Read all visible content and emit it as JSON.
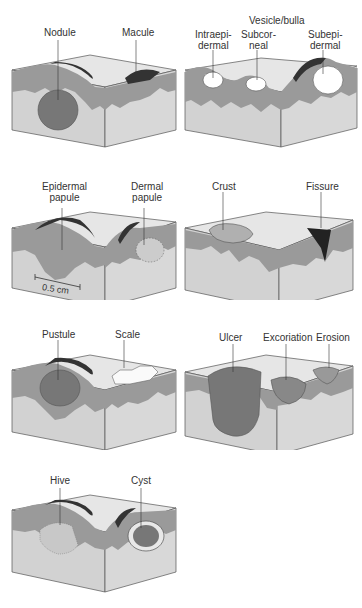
{
  "diagram": {
    "colors": {
      "surface": "#e6e6e6",
      "epidermis": "#9a9a9a",
      "dermis": "#d2d2d2",
      "shadow": "#3a3a3a",
      "outline": "#555555"
    },
    "panels": [
      {
        "id": "nodule-macule",
        "labels": [
          "Nodule",
          "Macule"
        ]
      },
      {
        "id": "vesicle-bulla",
        "group_label": "Vesicle/bulla",
        "labels": [
          "Intraepi-\ndermal",
          "Subcor-\nneal",
          "Subepi-\ndermal"
        ]
      },
      {
        "id": "papules",
        "labels": [
          "Epidermal\npapule",
          "Dermal\npapule"
        ],
        "scale_bar": "0.5 cm"
      },
      {
        "id": "crust-fissure",
        "labels": [
          "Crust",
          "Fissure"
        ]
      },
      {
        "id": "pustule-scale",
        "labels": [
          "Pustule",
          "Scale"
        ]
      },
      {
        "id": "ulcer-excoriation-erosion",
        "labels": [
          "Ulcer",
          "Excoriation",
          "Erosion"
        ]
      },
      {
        "id": "hive-cyst",
        "labels": [
          "Hive",
          "Cyst"
        ]
      }
    ]
  }
}
